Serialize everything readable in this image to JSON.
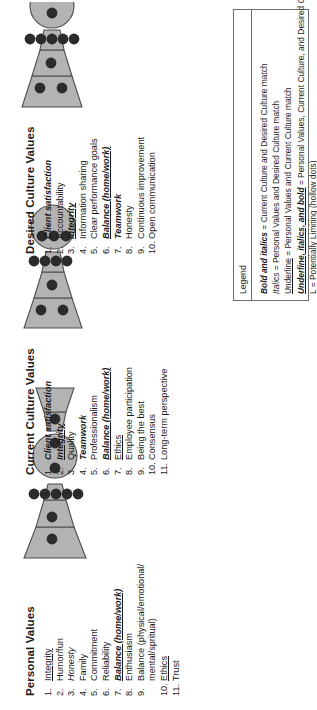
{
  "panels": [
    {
      "id": "personal-values",
      "title": "Personal Values",
      "items": [
        {
          "num": "1.",
          "text": "Integrity",
          "style": "un"
        },
        {
          "num": "2.",
          "text": "Humor/fun",
          "style": ""
        },
        {
          "num": "3.",
          "text": "Honesty",
          "style": "it"
        },
        {
          "num": "4.",
          "text": "Family",
          "style": ""
        },
        {
          "num": "5.",
          "text": "Commitment",
          "style": ""
        },
        {
          "num": "6.",
          "text": "Reliability",
          "style": ""
        },
        {
          "num": "7.",
          "text": "Balance (home/work)",
          "style": "ubi"
        },
        {
          "num": "8.",
          "text": "Enthusiasm",
          "style": ""
        },
        {
          "num": "9.",
          "text": "Balance (physical/emotional/",
          "style": ""
        },
        {
          "num": "",
          "text": "mental/spritual)",
          "style": "",
          "sub": true
        },
        {
          "num": "10.",
          "text": "Ethics",
          "style": "un"
        },
        {
          "num": "11.",
          "text": "Trust",
          "style": ""
        }
      ]
    },
    {
      "id": "current-culture-values",
      "title": "Current Culture Values",
      "items": [
        {
          "num": "1.",
          "text": "Client satisfaction",
          "style": "bi"
        },
        {
          "num": "2.",
          "text": "Integrity",
          "style": "ubi"
        },
        {
          "num": "3.",
          "text": "Quality",
          "style": ""
        },
        {
          "num": "4.",
          "text": "Teamwork",
          "style": "bi"
        },
        {
          "num": "5.",
          "text": "Professionalism",
          "style": ""
        },
        {
          "num": "6.",
          "text": "Balance (home/work)",
          "style": "ubi"
        },
        {
          "num": "7.",
          "text": "Ethics",
          "style": "un"
        },
        {
          "num": "8.",
          "text": "Employee participation",
          "style": ""
        },
        {
          "num": "9.",
          "text": "Being the best",
          "style": ""
        },
        {
          "num": "10.",
          "text": "Consensus",
          "style": ""
        },
        {
          "num": "11.",
          "text": "Long-term perspective",
          "style": ""
        }
      ]
    },
    {
      "id": "desired-culture-values",
      "title": "Desired Culture Values",
      "items": [
        {
          "num": "1.",
          "text": "Client satisfaction",
          "style": "bi"
        },
        {
          "num": "2.",
          "text": "Accountability",
          "style": ""
        },
        {
          "num": "3.",
          "text": "Integrity",
          "style": "ubi"
        },
        {
          "num": "4.",
          "text": "Information sharing",
          "style": ""
        },
        {
          "num": "5.",
          "text": "Clear performance goals",
          "style": ""
        },
        {
          "num": "6.",
          "text": "Balance (home/work)",
          "style": "ubi"
        },
        {
          "num": "7.",
          "text": "Teamwork",
          "style": "bi"
        },
        {
          "num": "8.",
          "text": "Honesty",
          "style": ""
        },
        {
          "num": "9.",
          "text": "Continuous improvement",
          "style": ""
        },
        {
          "num": "10.",
          "text": "Open communication",
          "style": ""
        }
      ]
    }
  ],
  "legend": {
    "title": "Legend",
    "lines": [
      {
        "key": "Bold and italics",
        "key_style": "bi",
        "rest": " = Current Culture and Desired Culture match"
      },
      {
        "key": "Italics",
        "key_style": "it",
        "rest": " = Personal Values and Desired Culture match"
      },
      {
        "key": "Underline",
        "key_style": "un",
        "rest": " = Personal Values and Current Culture match"
      },
      {
        "key": "Underline, italics, and bold",
        "key_style": "ubi",
        "rest": " = Personal Values, Current Culture, and Desired Culture match"
      },
      {
        "key": "L",
        "key_style": "",
        "rest": " = Potentially Limiting (hollow dots)"
      }
    ]
  },
  "colors": {
    "shape_fill": "#b3b3b3",
    "shape_stroke": "#4d4d4d",
    "dot_fill": "#2b2b2b",
    "text": "#1a1a1a",
    "legend_border": "#6e6e6e"
  },
  "diagrams": [
    {
      "id": "personal-values-diagram",
      "dots": [
        {
          "cx": 21,
          "cy": 30,
          "r": 5.4
        },
        {
          "cx": 43,
          "cy": 30,
          "r": 5.4
        },
        {
          "cx": 66,
          "cy": 12,
          "r": 5.4
        },
        {
          "cx": 66,
          "cy": 23,
          "r": 5.4
        },
        {
          "cx": 66,
          "cy": 34,
          "r": 5.4
        },
        {
          "cx": 66,
          "cy": 45,
          "r": 5.4
        },
        {
          "cx": 66,
          "cy": 56,
          "r": 5.4
        },
        {
          "cx": 92,
          "cy": 33,
          "r": 5.4
        },
        {
          "cx": 117,
          "cy": 33,
          "r": 5.4
        },
        {
          "cx": 141,
          "cy": 33,
          "r": 5.4
        }
      ]
    },
    {
      "id": "current-culture-diagram",
      "dots": [
        {
          "cx": 20,
          "cy": 19,
          "r": 5.4
        },
        {
          "cx": 20,
          "cy": 41,
          "r": 5.4
        },
        {
          "cx": 45,
          "cy": 30,
          "r": 5.4
        },
        {
          "cx": 69,
          "cy": 12,
          "r": 5.4
        },
        {
          "cx": 69,
          "cy": 23,
          "r": 5.4
        },
        {
          "cx": 69,
          "cy": 34,
          "r": 5.4
        },
        {
          "cx": 69,
          "cy": 45,
          "r": 5.4
        },
        {
          "cx": 94,
          "cy": 20,
          "r": 5.4
        },
        {
          "cx": 94,
          "cy": 32,
          "r": 5.4
        },
        {
          "cx": 94,
          "cy": 44,
          "r": 5.4
        }
      ]
    },
    {
      "id": "desired-culture-diagram",
      "dots": [
        {
          "cx": 22,
          "cy": 20,
          "r": 5.4
        },
        {
          "cx": 22,
          "cy": 42,
          "r": 5.4
        },
        {
          "cx": 47,
          "cy": 31,
          "r": 5.4
        },
        {
          "cx": 71,
          "cy": 10,
          "r": 5.4
        },
        {
          "cx": 71,
          "cy": 21,
          "r": 5.4
        },
        {
          "cx": 71,
          "cy": 32,
          "r": 5.4
        },
        {
          "cx": 71,
          "cy": 43,
          "r": 5.4
        },
        {
          "cx": 71,
          "cy": 54,
          "r": 5.4
        },
        {
          "cx": 97,
          "cy": 32,
          "r": 5.4
        },
        {
          "cx": 122,
          "cy": 32,
          "r": 5.4
        }
      ]
    }
  ]
}
